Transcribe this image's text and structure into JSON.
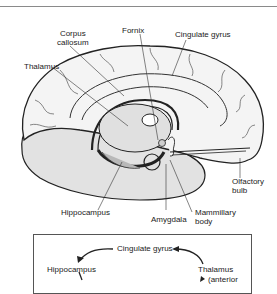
{
  "figure": {
    "labels": {
      "corpus_callosum": "Corpus\ncallosum",
      "corpus_line1": "Corpus",
      "corpus_line2": "callosum",
      "fornix": "Fornix",
      "cingulate_gyrus": "Cingulate gyrus",
      "thalamus": "Thalamus",
      "olfactory_line1": "Olfactory",
      "olfactory_line2": "bulb",
      "hippocampus": "Hippocampus",
      "amygdala": "Amygdala",
      "mammillary_line1": "Mammillary",
      "mammillary_line2": "body"
    },
    "colors": {
      "outline": "#222222",
      "cortex_fill": "#f2f2f2",
      "inner_fill": "#dcdcdc",
      "limbic_fill": "#bdbdbd",
      "cerebellum_fill": "#e4e4e4"
    }
  },
  "flow": {
    "nodes": {
      "cingulate_gyrus": "Cingulate gyrus",
      "hippocampus": "Hippocampus",
      "thalamus": "Thalamus",
      "thalamus_sub": "(anterior"
    }
  }
}
